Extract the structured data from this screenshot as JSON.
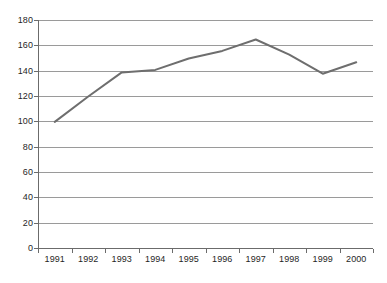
{
  "chart_data": {
    "type": "line",
    "title": "",
    "subtitle": "",
    "xlabel": "",
    "ylabel": "",
    "categories": [
      "1991",
      "1992",
      "1993",
      "1994",
      "1995",
      "1996",
      "1997",
      "1998",
      "1999",
      "2000"
    ],
    "x": [
      1991,
      1992,
      1993,
      1994,
      1995,
      1996,
      1997,
      1998,
      1999,
      2000
    ],
    "series": [
      {
        "name": "index",
        "color": "#6e6e6e",
        "values": [
          100,
          120,
          139,
          141,
          150,
          156,
          165,
          153,
          138,
          147
        ]
      }
    ],
    "values": [
      100,
      120,
      139,
      141,
      150,
      156,
      165,
      153,
      138,
      147
    ],
    "ylim": [
      0,
      180
    ],
    "ytick_values": [
      0,
      20,
      40,
      60,
      80,
      100,
      120,
      140,
      160,
      180
    ],
    "ytick_labels": [
      "0",
      "20",
      "40",
      "60",
      "80",
      "100",
      "120",
      "140",
      "160",
      "180"
    ],
    "grid": "horizontal",
    "grid_color": "#9a9a9a",
    "legend": "none",
    "legend_position": "",
    "annotations": [],
    "axis_color": "#6b6b6b",
    "background_color": "#ffffff",
    "line_width": 2
  },
  "axes": {
    "y_labels": [
      "180",
      "160",
      "140",
      "120",
      "100",
      "80",
      "60",
      "40",
      "20",
      "0"
    ],
    "x_labels": [
      "1991",
      "1992",
      "1993",
      "1994",
      "1995",
      "1996",
      "1997",
      "1998",
      "1999",
      "2000"
    ]
  }
}
